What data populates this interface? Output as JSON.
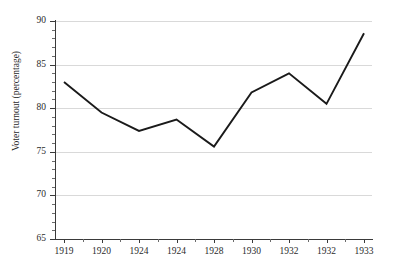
{
  "chart_data": {
    "type": "line",
    "title": "",
    "xlabel": "",
    "ylabel": "Voter turnout (percentage)",
    "categories": [
      "1919",
      "1920",
      "1924",
      "1924",
      "1928",
      "1930",
      "1932",
      "1932",
      "1933"
    ],
    "values": [
      83.0,
      79.5,
      77.4,
      78.7,
      75.6,
      81.8,
      84.0,
      80.5,
      88.6
    ],
    "series": [
      {
        "name": "Voter turnout",
        "values": [
          83.0,
          79.5,
          77.4,
          78.7,
          75.6,
          81.8,
          84.0,
          80.5,
          88.6
        ],
        "color": "#1a1a1a"
      }
    ],
    "ylim": [
      65,
      90
    ],
    "ytick_labels": [
      "65",
      "70",
      "75",
      "80",
      "85",
      "90"
    ],
    "ytick_values": [
      65,
      70,
      75,
      80,
      85,
      90
    ],
    "yminor_step": 1,
    "grid": true,
    "grid_color": "#d9d9d9",
    "legend": "none",
    "axis_color": "#3a3a3a",
    "background": "#ffffff"
  }
}
